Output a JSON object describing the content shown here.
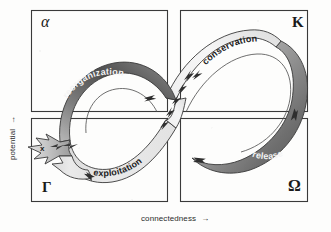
{
  "figure": {
    "type": "adaptive-cycle-diagram",
    "title": "",
    "background_color": "#fdfdfc",
    "line_color": "#3a3a3a"
  },
  "axes": {
    "y": {
      "label": "potential",
      "arrow": "→",
      "direction": "up"
    },
    "x": {
      "label": "connectedness",
      "arrow": "→",
      "direction": "right"
    }
  },
  "quadrants": [
    {
      "id": "alpha",
      "label": "α",
      "name": "alpha-quadrant",
      "position": "top-left"
    },
    {
      "id": "kappa",
      "label": "K",
      "name": "kappa-quadrant",
      "position": "top-right"
    },
    {
      "id": "gamma",
      "label": "r",
      "label_glyph": "Γ",
      "name": "r-quadrant",
      "position": "bottom-left"
    },
    {
      "id": "omega",
      "label": "Ω",
      "name": "omega-quadrant",
      "position": "bottom-right"
    }
  ],
  "phases": [
    {
      "id": "reorganization",
      "label": "reorganization",
      "text_color": "#f4f4f4",
      "ribbon_shade": "dark",
      "quadrant": "alpha"
    },
    {
      "id": "exploitation",
      "label": "exploitation",
      "text_color": "#212121",
      "ribbon_shade": "light",
      "quadrant": "r"
    },
    {
      "id": "conservation",
      "label": "conservation",
      "text_color": "#212121",
      "ribbon_shade": "light",
      "quadrant": "K"
    },
    {
      "id": "release",
      "label": "release",
      "text_color": "#f4f4f4",
      "ribbon_shade": "dark",
      "quadrant": "Ω"
    }
  ],
  "annotations": [
    {
      "id": "exit",
      "label": "x",
      "description": "revolt / exit arrow leaving the cycle to the left"
    }
  ],
  "colors": {
    "ribbon_dark": "#6b6b6b",
    "ribbon_mid": "#9a9a9a",
    "ribbon_light": "#dcdcdc",
    "stroke": "#3a3a3a",
    "text_dark": "#212121",
    "text_light": "#f4f4f4"
  }
}
